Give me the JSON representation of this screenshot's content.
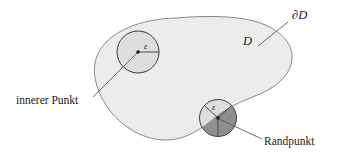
{
  "figure": {
    "labels": {
      "region": "D",
      "boundary": "∂D",
      "interior_caption": "innerer Punkt",
      "boundary_caption": "Randpunkt",
      "epsilon_interior": "ε",
      "epsilon_boundary": "ε"
    },
    "colors": {
      "region_fill": "#ececec",
      "region_stroke": "#8a8a8a",
      "disc_fill_light": "#dedede",
      "disc_fill_dark": "#8f8f8f",
      "disc_stroke": "#3c3c3c",
      "leader_line": "#5a5a5a",
      "text": "#1b1b1b",
      "page_background": "#ffffff"
    },
    "geometry": {
      "canvas_width": 340,
      "canvas_height": 153,
      "interior_disc": {
        "cx": 138,
        "cy": 52,
        "r": 21
      },
      "boundary_disc": {
        "cx": 218,
        "cy": 118,
        "r": 18.5
      }
    }
  }
}
